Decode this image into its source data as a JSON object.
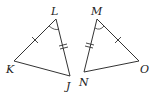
{
  "figure": {
    "triangles": [
      {
        "name": "triangle-LKJ",
        "vertices": {
          "L": {
            "label": "L",
            "x": 56,
            "y": 19
          },
          "K": {
            "label": "K",
            "x": 14,
            "y": 61
          },
          "J": {
            "label": "J",
            "x": 70,
            "y": 76
          }
        },
        "marks": {
          "LK": "single-tick",
          "LJ": "double-tick",
          "angle_L": "arc"
        }
      },
      {
        "name": "triangle-MNO",
        "vertices": {
          "M": {
            "label": "M",
            "x": 97,
            "y": 19
          },
          "N": {
            "label": "N",
            "x": 84,
            "y": 72
          },
          "O": {
            "label": "O",
            "x": 139,
            "y": 61
          }
        },
        "marks": {
          "MO": "single-tick",
          "MN": "double-tick",
          "angle_M": "arc"
        }
      }
    ]
  },
  "labels": {
    "L": "L",
    "K": "K",
    "J": "J",
    "M": "M",
    "N": "N",
    "O": "O"
  },
  "colors": {
    "stroke": "#333333",
    "background": "#ffffff"
  }
}
